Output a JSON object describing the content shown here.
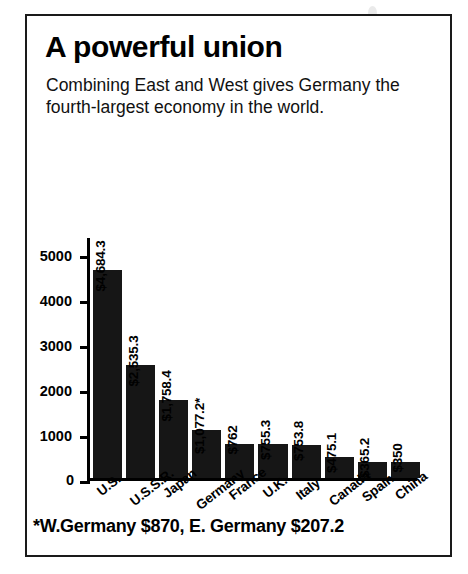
{
  "figure": {
    "title": "A powerful union",
    "subtitle": "Combining East and West gives Germany the fourth-largest economy in the world.",
    "footnote": "*W.Germany $870, E. Germany $207.2",
    "border_color": "#1a1a1a",
    "bar_color": "#161616",
    "background": "#ffffff"
  },
  "chart_data": {
    "type": "bar",
    "title": "A powerful union",
    "subtitle": "Combining East and West gives Germany the fourth-largest economy in the world.",
    "xlabel": "",
    "ylabel": "",
    "ylim": [
      0,
      5400
    ],
    "grid": false,
    "legend": "none",
    "orientation": "vertical",
    "yticks": [
      0,
      1000,
      2000,
      3000,
      4000,
      5000
    ],
    "ytick_labels": [
      "0",
      "1000",
      "2000",
      "3000",
      "4000",
      "5000"
    ],
    "categories": [
      "U.S.",
      "U.S.S.R.",
      "Japan",
      "Germany",
      "France",
      "U.K.",
      "Italy",
      "Canada",
      "Spain",
      "China"
    ],
    "values": [
      4684.3,
      2535.3,
      1758.4,
      1077.2,
      762,
      755.3,
      753.8,
      475.1,
      365.2,
      350
    ],
    "value_labels": [
      "$4,684.3",
      "$2,535.3",
      "$1,758.4",
      "$1,077.2*",
      "$762",
      "$755.3",
      "$753.8",
      "$475.1",
      "$365.2",
      "$350"
    ],
    "annotations": [
      "*W.Germany $870, E. Germany $207.2"
    ],
    "units": "billions of U.S. dollars"
  },
  "bars": [
    {
      "category": "U.S.",
      "value": 4684.3,
      "label": "$4,684.3"
    },
    {
      "category": "U.S.S.R.",
      "value": 2535.3,
      "label": "$2,535.3"
    },
    {
      "category": "Japan",
      "value": 1758.4,
      "label": "$1,758.4"
    },
    {
      "category": "Germany",
      "value": 1077.2,
      "label": "$1,077.2*"
    },
    {
      "category": "France",
      "value": 762,
      "label": "$762"
    },
    {
      "category": "U.K.",
      "value": 755.3,
      "label": "$755.3"
    },
    {
      "category": "Italy",
      "value": 753.8,
      "label": "$753.8"
    },
    {
      "category": "Canada",
      "value": 475.1,
      "label": "$475.1"
    },
    {
      "category": "Spain",
      "value": 365.2,
      "label": "$365.2"
    },
    {
      "category": "China",
      "value": 350,
      "label": "$350"
    }
  ],
  "yaxis": {
    "ticks": [
      "5000",
      "4000",
      "3000",
      "2000",
      "1000",
      "0"
    ]
  }
}
